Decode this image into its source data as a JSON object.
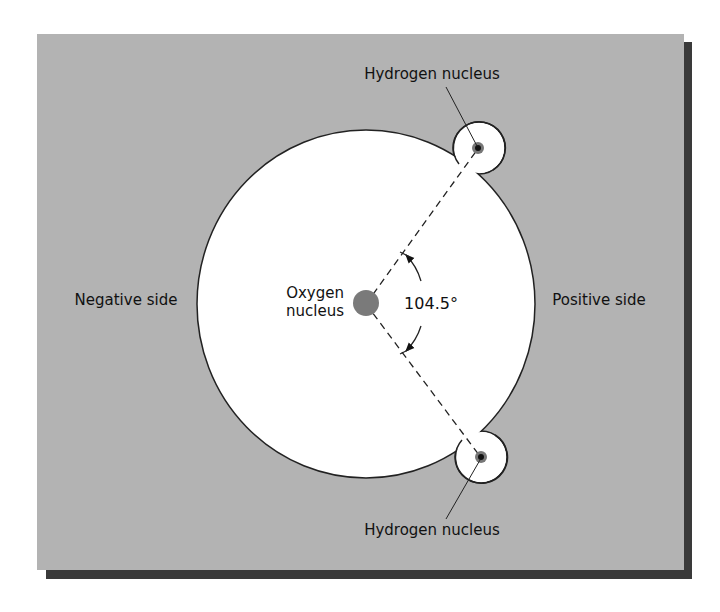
{
  "figure": {
    "labels": {
      "hydrogen_top": "Hydrogen nucleus",
      "hydrogen_bottom": "Hydrogen nucleus",
      "oxygen_line1": "Oxygen",
      "oxygen_line2": "nucleus",
      "angle": "104.5°",
      "negative_side": "Negative side",
      "positive_side": "Positive side"
    },
    "colors": {
      "panel_background": "#b3b3b3",
      "panel_shadow": "#3a3a3a",
      "electron_cloud": "#ffffff",
      "outline": "#222222",
      "oxygen_nucleus": "#7a7a7a",
      "hydrogen_nucleus_core": "#111111",
      "hydrogen_nucleus_halo": "#777777"
    },
    "bond_angle_degrees": 104.5
  }
}
